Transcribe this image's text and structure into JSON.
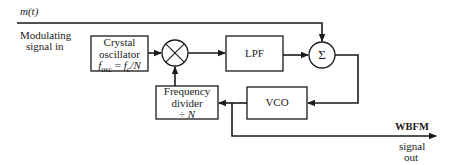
{
  "diagram": {
    "input": {
      "signal_label": "m(t)",
      "caption_line1": "Modulating",
      "caption_line2": "signal in"
    },
    "blocks": {
      "crystal_oscillator": {
        "line1": "Crystal",
        "line2": "oscillator",
        "formula_lhs": "f",
        "formula_lhs_sub": "osc",
        "formula_eq": " = ",
        "formula_rhs": "f",
        "formula_rhs_sub": "c",
        "formula_tail": "/N"
      },
      "multiplier": {
        "symbol": "⊗"
      },
      "lpf": {
        "label": "LPF"
      },
      "summer": {
        "symbol": "Σ"
      },
      "vco": {
        "label": "VCO"
      },
      "frequency_divider": {
        "line1": "Frequency",
        "line2": "divider",
        "line3_op": "÷ ",
        "line3_var": "N"
      }
    },
    "output": {
      "label": "WBFM",
      "caption_line1": "signal",
      "caption_line2": "out"
    },
    "colors": {
      "stroke": "#1a1a1a",
      "background": "#ffffff"
    }
  }
}
